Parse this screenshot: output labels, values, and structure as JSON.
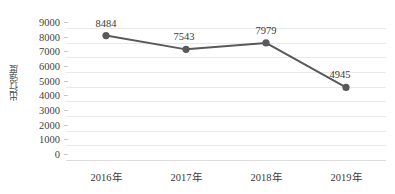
{
  "chart_data": {
    "type": "line",
    "title": "",
    "subtitle": "",
    "xlabel": "",
    "ylabel": "出行强度",
    "categories": [
      "2016年",
      "2017年",
      "2018年",
      "2019年"
    ],
    "values": [
      8484,
      7543,
      7979,
      4945
    ],
    "data_labels": [
      "8484",
      "7543",
      "7979",
      "4945"
    ],
    "ylim": [
      0,
      9000
    ],
    "ytick_values": [
      9000,
      8000,
      7000,
      6000,
      5000,
      4000,
      3000,
      2000,
      1000,
      0
    ],
    "ytick_labels": [
      "9000",
      "8000",
      "7000",
      "6000",
      "5000",
      "4000",
      "3000",
      "2000",
      "1000",
      "0"
    ],
    "grid": true,
    "grid_axis": "y",
    "legend": false,
    "legend_position": "none",
    "series": [
      {
        "name": "出行强度",
        "values": [
          8484,
          7543,
          7979,
          4945
        ],
        "line_color": "#595959",
        "marker_color": "#595959",
        "marker": "circle"
      }
    ],
    "colors": {
      "line": "#595959",
      "marker": "#595959",
      "grid": "#e9e9e9",
      "axis": "#dcdcdc",
      "text": "#3a3a3a",
      "background": "#ffffff"
    }
  }
}
